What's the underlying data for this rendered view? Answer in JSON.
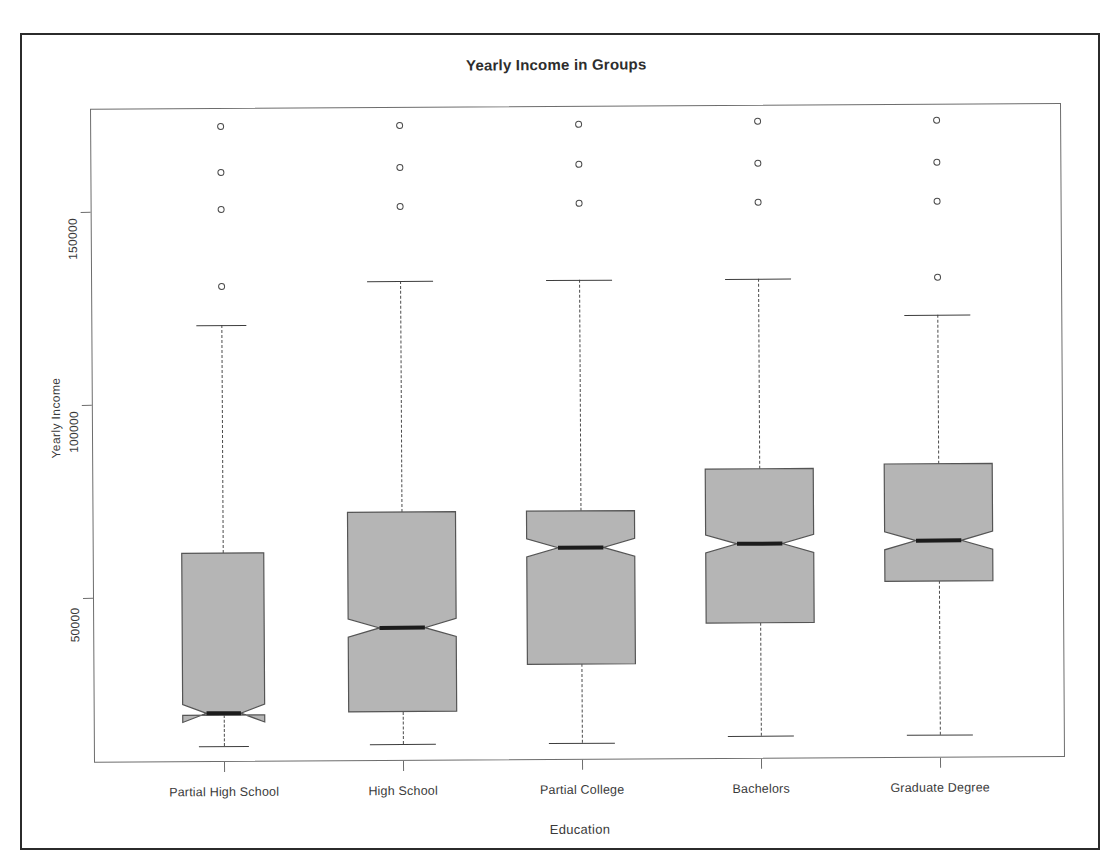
{
  "chart_data": {
    "type": "box",
    "title": "Yearly Income in Groups",
    "xlabel": "Education",
    "ylabel": "Yearly Income",
    "grid": false,
    "legend": "none",
    "ylim": [
      5000,
      180000
    ],
    "ytick_labels": [
      "50000",
      "100000",
      "150000"
    ],
    "ytick_values": [
      50000,
      100000,
      150000
    ],
    "categories": [
      "Partial High School",
      "High School",
      "Partial College",
      "Bachelors",
      "Graduate Degree"
    ],
    "boxes": [
      {
        "category": "Partial High School",
        "whisker_low": 11500,
        "q1": 19500,
        "median": 20000,
        "q3": 61500,
        "whisker_high": 120500,
        "outliers": [
          130500,
          150500,
          160000,
          172000
        ]
      },
      {
        "category": "High School",
        "whisker_low": 11700,
        "q1": 20000,
        "median": 41700,
        "q3": 71700,
        "whisker_high": 131500,
        "outliers": [
          151000,
          161000,
          172000
        ]
      },
      {
        "category": "Partial College",
        "whisker_low": 11700,
        "q1": 32000,
        "median": 62200,
        "q3": 71700,
        "whisker_high": 131500,
        "outliers": [
          151500,
          161500,
          172000
        ]
      },
      {
        "category": "Bachelors",
        "whisker_low": 13200,
        "q1": 42500,
        "median": 63000,
        "q3": 82400,
        "whisker_high": 131500,
        "outliers": [
          151500,
          161500,
          172500
        ]
      },
      {
        "category": "Graduate Degree",
        "whisker_low": 13200,
        "q1": 53000,
        "median": 63500,
        "q3": 83400,
        "whisker_high": 122000,
        "outliers": [
          131700,
          151500,
          161500,
          172500
        ]
      }
    ]
  },
  "colors": {
    "box_fill": "#b5b5b5",
    "box_stroke": "#555555",
    "median_stroke": "#1c1c1c",
    "axis": "#6d6d6d",
    "text": "#3a3a3a",
    "frame": "#2b2b2b"
  }
}
